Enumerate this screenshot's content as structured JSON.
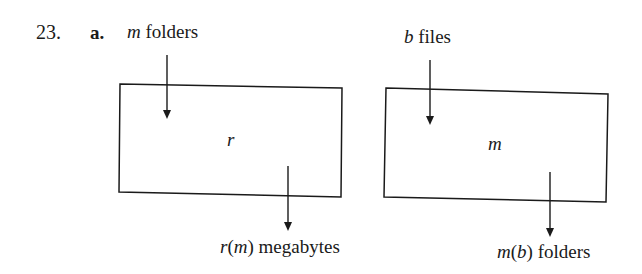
{
  "problem": {
    "number": "23.",
    "part": "a."
  },
  "diagram_left": {
    "input_var": "m",
    "input_label": " folders",
    "function_name": "r",
    "output_func": "r",
    "output_paren_open": "(",
    "output_arg": "m",
    "output_paren_close": ")",
    "output_label": " megabytes"
  },
  "diagram_right": {
    "input_var": "b",
    "input_label": " files",
    "function_name": "m",
    "output_func": "m",
    "output_paren_open": "(",
    "output_arg": "b",
    "output_paren_close": ")",
    "output_label": " folders"
  },
  "colors": {
    "ink": "#1a1a1a",
    "background": "#ffffff"
  }
}
